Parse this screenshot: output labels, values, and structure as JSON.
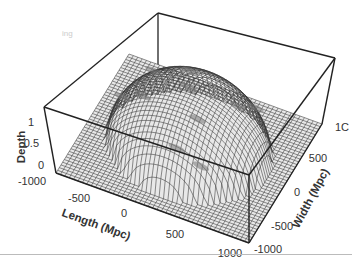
{
  "chart_data": {
    "type": "surface3d",
    "title": "",
    "xlabel": "Length (Mpc)",
    "ylabel": "Width (Mpc)",
    "zlabel": "Depth",
    "xlim": [
      -1000,
      1000
    ],
    "ylim": [
      -1000,
      1000
    ],
    "zlim": [
      0,
      1.3
    ],
    "x_ticks": [
      "-1000",
      "-500",
      "0",
      "500",
      "1000"
    ],
    "y_ticks": [
      "-1000",
      "-500",
      "0",
      "500",
      "1000"
    ],
    "z_ticks": [
      "0",
      "0.5",
      "1"
    ],
    "surface": {
      "shape": "dome",
      "peak_depth": 1.2,
      "peak_location": [
        0,
        0
      ],
      "radius_mpc": 800,
      "baseline_depth": 0,
      "mesh": "wireframe",
      "mesh_color": "#333333",
      "fill_color": "#ffffff",
      "highlight_patches_color": "#777777"
    },
    "grid": false,
    "box": true,
    "legend": null
  },
  "labels": {
    "z_axis": "Depth",
    "x_axis": "Length (Mpc)",
    "y_axis": "Width (Mpc)",
    "z_ticks": [
      "0",
      "0.5",
      "1"
    ],
    "x_ticks": [
      "-1000",
      "-500",
      "0",
      "500",
      "1000"
    ],
    "y_ticks": [
      "-1000",
      "-500",
      "0",
      "500",
      "1C"
    ],
    "watermark": "ing"
  }
}
